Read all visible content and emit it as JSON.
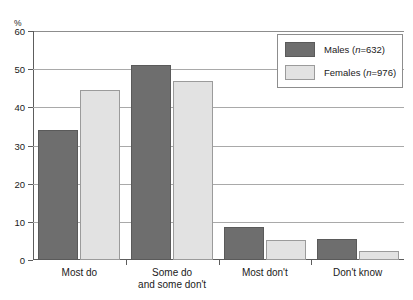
{
  "figure": {
    "title_sliver": "",
    "unit_label": "%"
  },
  "legend": {
    "entries": [
      {
        "label_prefix": "Males (",
        "n_symbol": "n",
        "label_suffix": "=632)",
        "full": "Males (n=632)",
        "color": "#6e6e6e"
      },
      {
        "label_prefix": "Females (",
        "n_symbol": "n",
        "label_suffix": "=976)",
        "full": "Females (n=976)",
        "color": "#e2e2e2"
      }
    ]
  },
  "axes": {
    "y_ticks": [
      "0",
      "10",
      "20",
      "30",
      "40",
      "50",
      "60"
    ],
    "x_labels": [
      "Most do",
      "Some do\nand some don't",
      "Most don't",
      "Don't know"
    ]
  },
  "chart_data": {
    "type": "bar",
    "title": "",
    "xlabel": "",
    "ylabel": "%",
    "ylim": [
      0,
      60
    ],
    "yticks": [
      0,
      10,
      20,
      30,
      40,
      50,
      60
    ],
    "grid": true,
    "legend_position": "upper-right",
    "categories": [
      "Most do",
      "Some do and some don't",
      "Most don't",
      "Don't know"
    ],
    "series": [
      {
        "name": "Males (n=632)",
        "color": "#6e6e6e",
        "n": 632,
        "values": [
          34,
          51,
          8.7,
          5.5
        ]
      },
      {
        "name": "Females (n=976)",
        "color": "#e2e2e2",
        "n": 976,
        "values": [
          44.5,
          47,
          5.2,
          2.3
        ]
      }
    ]
  }
}
